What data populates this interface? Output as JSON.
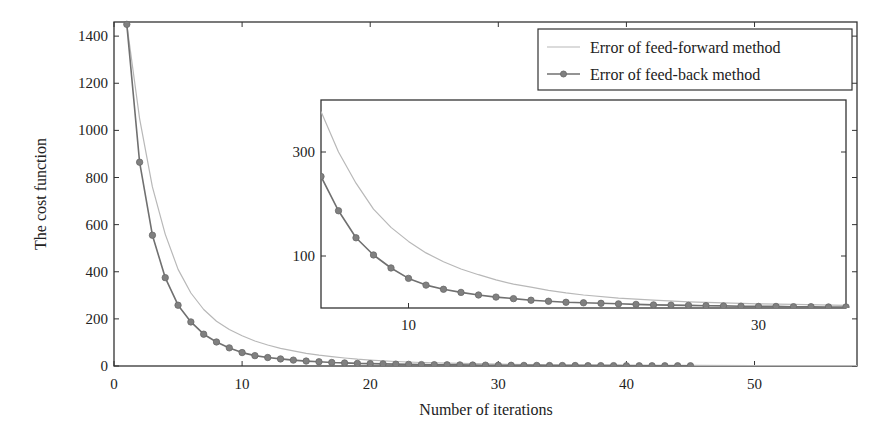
{
  "chart_data": [
    {
      "id": "main",
      "type": "line",
      "title": "",
      "xlabel": "Number of iterations",
      "ylabel": "The cost function",
      "xlim": [
        0,
        58
      ],
      "ylim": [
        0,
        1460
      ],
      "xticks": [
        0,
        10,
        20,
        30,
        40,
        50
      ],
      "yticks": [
        0,
        200,
        400,
        600,
        800,
        1000,
        1200,
        1400
      ],
      "grid": false,
      "legend_position": "upper right",
      "series": [
        {
          "name": "Error of feed-forward method",
          "style": "line",
          "color": "#b8b8b8",
          "x": [
            1,
            2,
            3,
            4,
            5,
            6,
            7,
            8,
            9,
            10,
            11,
            12,
            13,
            14,
            15,
            16,
            17,
            18,
            19,
            20,
            22,
            24,
            26,
            28,
            30,
            33,
            36,
            40,
            45,
            50,
            55,
            58
          ],
          "values": [
            1450,
            1050,
            760,
            560,
            410,
            310,
            240,
            190,
            155,
            128,
            106,
            89,
            75,
            64,
            54,
            46,
            40,
            34,
            29,
            25,
            19,
            15,
            12,
            10,
            8,
            6,
            5,
            4,
            3,
            2,
            2,
            2
          ]
        },
        {
          "name": "Error of feed-back method",
          "style": "line+marker",
          "color": "#707070",
          "x": [
            1,
            2,
            3,
            4,
            5,
            6,
            7,
            8,
            9,
            10,
            11,
            12,
            13,
            14,
            15,
            16,
            17,
            18,
            19,
            20,
            21,
            22,
            23,
            24,
            25,
            26,
            27,
            28,
            29,
            30,
            31,
            32,
            33,
            34,
            35,
            36,
            37,
            38,
            39,
            40,
            41,
            42,
            43,
            44,
            45
          ],
          "values": [
            1450,
            865,
            555,
            375,
            258,
            187,
            135,
            102,
            77,
            57,
            44,
            36,
            30,
            25,
            21,
            18,
            15,
            13,
            11,
            10,
            9,
            8,
            7,
            6,
            5.5,
            5,
            4.5,
            4,
            3.5,
            3,
            3,
            2.5,
            2.5,
            2,
            2,
            2,
            1.5,
            1.5,
            1.5,
            1,
            1,
            1,
            1,
            1,
            1
          ]
        }
      ]
    },
    {
      "id": "inset",
      "type": "line",
      "title": "",
      "xlabel": "",
      "ylabel": "",
      "xlim": [
        5,
        35
      ],
      "ylim": [
        0,
        400
      ],
      "xticks": [
        10,
        30
      ],
      "yticks": [
        100,
        300
      ],
      "grid": false,
      "series": [
        {
          "name": "Error of feed-forward method",
          "style": "line",
          "color": "#b8b8b8",
          "x": [
            5,
            6,
            7,
            8,
            9,
            10,
            11,
            12,
            13,
            14,
            15,
            16,
            17,
            18,
            19,
            20,
            22,
            24,
            26,
            28,
            30,
            32,
            35
          ],
          "values": [
            378,
            300,
            240,
            190,
            155,
            128,
            106,
            89,
            75,
            64,
            54,
            46,
            40,
            34,
            29,
            25,
            19,
            15,
            12,
            10,
            8,
            7,
            5
          ]
        },
        {
          "name": "Error of feed-back method",
          "style": "line+marker",
          "color": "#707070",
          "x": [
            5,
            6,
            7,
            8,
            9,
            10,
            11,
            12,
            13,
            14,
            15,
            16,
            17,
            18,
            19,
            20,
            21,
            22,
            23,
            24,
            25,
            26,
            27,
            28,
            29,
            30,
            31,
            32,
            33,
            34,
            35
          ],
          "values": [
            253,
            187,
            135,
            102,
            77,
            57,
            44,
            36,
            30,
            25,
            21,
            18,
            15,
            13,
            11,
            10,
            9,
            8,
            7,
            6,
            5.5,
            5,
            4.5,
            4,
            3.5,
            3,
            3,
            2.5,
            2.5,
            2,
            2
          ]
        }
      ]
    }
  ],
  "legend": {
    "items": [
      {
        "label": "Error of feed-forward method"
      },
      {
        "label": "Error of feed-back method"
      }
    ]
  }
}
